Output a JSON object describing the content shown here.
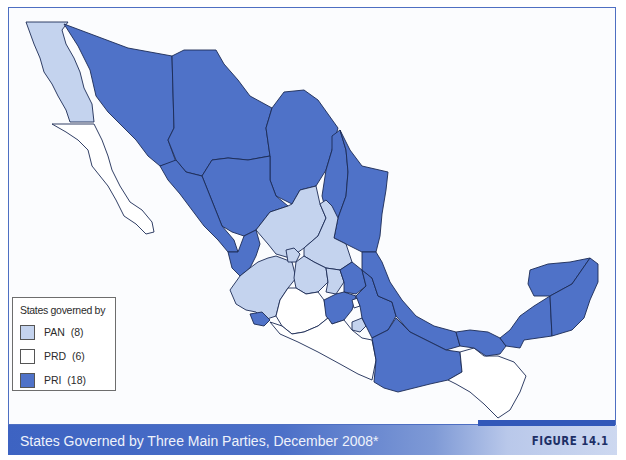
{
  "figure": {
    "caption": "States Governed by Three Main Parties, December 2008*",
    "label": "FIGURE 14.1"
  },
  "legend": {
    "title": "States governed by",
    "items": [
      {
        "party": "PAN",
        "count": "(8)",
        "label": "PAN  (8)",
        "color": "#c4d3ee"
      },
      {
        "party": "PRD",
        "count": "(6)",
        "label": "PRD  (6)",
        "color": "#ffffff"
      },
      {
        "party": "PRI",
        "count": "(18)",
        "label": "PRI  (18)",
        "color": "#4f72c8"
      }
    ]
  },
  "colors": {
    "pan": "#c4d3ee",
    "prd": "#ffffff",
    "pri": "#4f72c8",
    "frame": "#4e6fc2",
    "banner": "#3d63c2",
    "figure_label": "#1d2f66"
  },
  "map": {
    "subject": "Mexico by state",
    "party_totals": {
      "PAN": 8,
      "PRD": 6,
      "PRI": 18
    }
  }
}
